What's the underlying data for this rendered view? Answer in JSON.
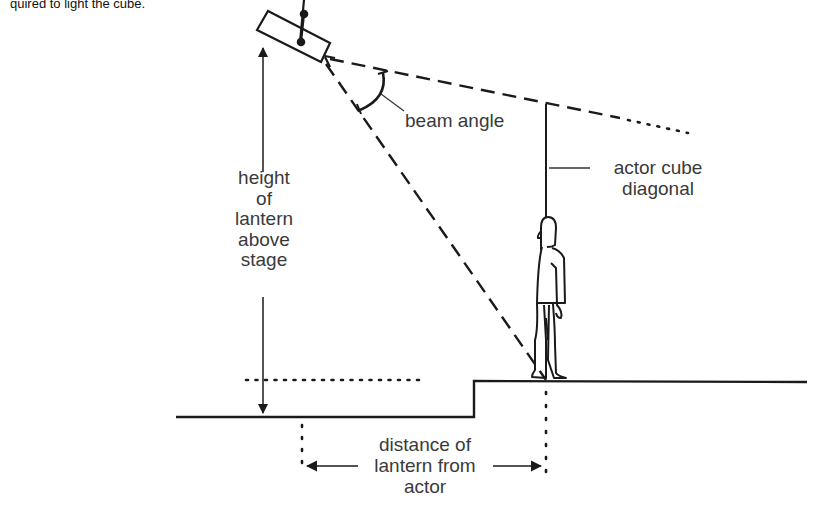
{
  "caption": "quired to light the cube.",
  "labels": {
    "beam_angle": "beam angle",
    "actor_cube_line1": "actor cube",
    "actor_cube_line2": "diagonal",
    "height_line1": "height",
    "height_line2": "of",
    "height_line3": "lantern",
    "height_line4": "above",
    "height_line5": "stage",
    "distance_line1": "distance of",
    "distance_line2": "lantern from",
    "distance_line3": "actor"
  },
  "elements": {
    "lantern": "stage-lantern-icon",
    "actor": "actor-figure-icon"
  },
  "colors": {
    "ink": "#1a1a1a",
    "text": "#3a3a3a",
    "background": "#ffffff"
  }
}
